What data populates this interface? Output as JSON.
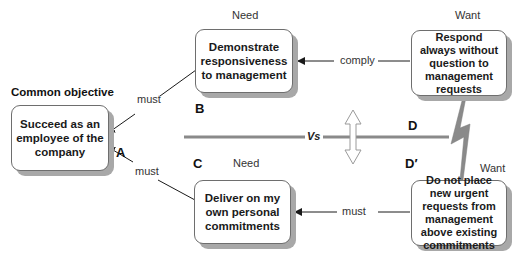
{
  "diagram": {
    "common_objective_label": "Common objective",
    "nodes": {
      "A": {
        "letter": "A",
        "text": "Succeed as an employee of the company"
      },
      "B": {
        "letter": "B",
        "header": "Need",
        "text": "Demonstrate responsiveness to management"
      },
      "C": {
        "letter": "C",
        "header": "Need",
        "text": "Deliver on my own personal commitments"
      },
      "D": {
        "letter": "D",
        "header": "Want",
        "text": "Respond always without question to management requests"
      },
      "D_prime": {
        "letter": "D′",
        "header": "Want",
        "text": "Do not place new urgent requests from management above existing commitments"
      }
    },
    "edges": {
      "B_to_A": "must",
      "C_to_A": "must",
      "D_to_B": "comply",
      "Dprime_to_C": "must"
    },
    "conflict_label": "Vs",
    "colors": {
      "box_border": "#6e6e6e",
      "box_shadow": "#a8a8a8",
      "conflict_line": "#8a8a8a",
      "lightning": "#8a8a8a",
      "arrow": "#1a1a1a"
    }
  }
}
